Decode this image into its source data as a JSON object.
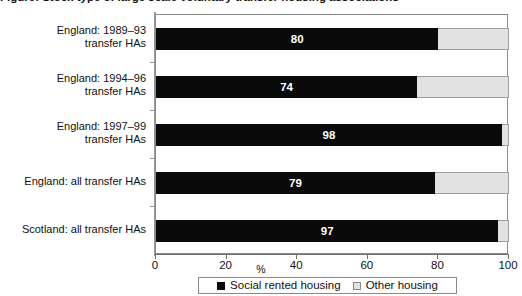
{
  "title_cropped": "Figure: Stock type of large scale voluntary transfer housing associations",
  "chart_data": {
    "type": "bar",
    "orientation": "horizontal",
    "stacked": true,
    "title": "",
    "xlabel": "%",
    "ylabel": "",
    "xlim": [
      0,
      100
    ],
    "xticks": [
      0,
      20,
      40,
      60,
      80,
      100
    ],
    "xtick_labels": [
      "0",
      "20",
      "40",
      "60",
      "80",
      "100"
    ],
    "grid": false,
    "legend_position": "bottom",
    "categories": [
      "England: 1989–93 transfer HAs",
      "England: 1994–96 transfer HAs",
      "England: 1997–99 transfer HAs",
      "England: all transfer HAs",
      "Scotland: all transfer HAs"
    ],
    "category_lines": [
      [
        "England: 1989–93",
        "transfer HAs"
      ],
      [
        "England: 1994–96",
        "transfer HAs"
      ],
      [
        "England: 1997–99",
        "transfer HAs"
      ],
      [
        "England: all transfer HAs",
        ""
      ],
      [
        "Scotland: all transfer HAs",
        ""
      ]
    ],
    "series": [
      {
        "name": "Social rented housing",
        "color": "#0a0a0a",
        "values": [
          80,
          74,
          98,
          79,
          97
        ],
        "labels": [
          "80",
          "74",
          "98",
          "79",
          "97"
        ]
      },
      {
        "name": "Other housing",
        "color": "#e2e2e2",
        "values": [
          20,
          26,
          2,
          21,
          3
        ],
        "labels": [
          "",
          "",
          "",
          "",
          ""
        ]
      }
    ]
  },
  "legend": {
    "items": [
      {
        "label": "Social rented housing",
        "swatch": "filled-square-icon"
      },
      {
        "label": "Other housing",
        "swatch": "open-square-icon"
      }
    ]
  },
  "colors": {
    "primary": "#0a0a0a",
    "other": "#e2e2e2",
    "axis": "#8a8a8a",
    "text": "#111111",
    "background": "#ffffff"
  }
}
